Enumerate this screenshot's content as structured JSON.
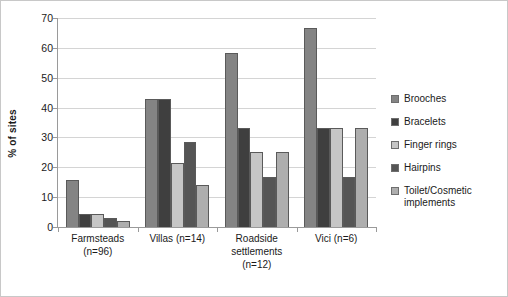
{
  "chart_data": {
    "type": "bar",
    "title": "",
    "subtitle": "",
    "xlabel": "",
    "ylabel": "% of sites",
    "ylim": [
      0,
      70
    ],
    "yticks": [
      0,
      10,
      20,
      30,
      40,
      50,
      60,
      70
    ],
    "ytick_labels": [
      "0",
      "10",
      "20",
      "30",
      "40",
      "50",
      "60",
      "70"
    ],
    "grid": true,
    "legend_position": "right",
    "categories": [
      "Farmsteads (n=96)",
      "Villas (n=14)",
      "Roadside settlements (n=12)",
      "Vici (n=6)"
    ],
    "category_lines": [
      [
        "Farmsteads",
        "(n=96)"
      ],
      [
        "Villas (n=14)"
      ],
      [
        "Roadside",
        "settlements",
        "(n=12)"
      ],
      [
        "Vici (n=6)"
      ]
    ],
    "series": [
      {
        "name": "Brooches",
        "color": "#848484",
        "values": [
          15.6,
          42.8,
          58.3,
          66.6
        ]
      },
      {
        "name": "Bracelets",
        "color": "#3f3f3f",
        "values": [
          4.2,
          42.8,
          33.3,
          33.3
        ]
      },
      {
        "name": "Finger rings",
        "color": "#c6c6c6",
        "values": [
          4.2,
          21.4,
          25.0,
          33.3
        ]
      },
      {
        "name": "Hairpins",
        "color": "#555555",
        "values": [
          3.1,
          28.5,
          16.6,
          16.6
        ]
      },
      {
        "name": "Toilet/Cosmetic implements",
        "color": "#aeaeae",
        "values": [
          2.1,
          14.2,
          25.0,
          33.3
        ]
      }
    ]
  },
  "legend": {
    "items": [
      {
        "label": "Brooches",
        "lines": [
          "Brooches"
        ]
      },
      {
        "label": "Bracelets",
        "lines": [
          "Bracelets"
        ]
      },
      {
        "label": "Finger rings",
        "lines": [
          "Finger rings"
        ]
      },
      {
        "label": "Hairpins",
        "lines": [
          "Hairpins"
        ]
      },
      {
        "label": "Toilet/Cosmetic implements",
        "lines": [
          "Toilet/Cosmetic",
          "implements"
        ]
      }
    ]
  },
  "colors": {
    "gridline": "#d4d4d4",
    "axis": "#9a9a9a",
    "border": "#c8c8c8",
    "text": "#1a1a1a",
    "background": "#ffffff"
  }
}
